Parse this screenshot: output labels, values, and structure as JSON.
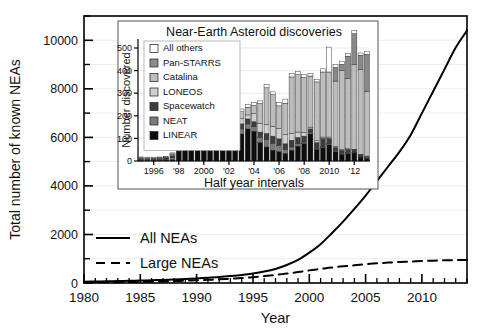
{
  "figure": {
    "background": "#ffffff",
    "line_color": "#000000"
  },
  "chart_data": [
    {
      "id": "main",
      "type": "line",
      "title": "",
      "xlabel": "Year",
      "ylabel": "Total number of known NEAs",
      "xlim": [
        1980,
        2014
      ],
      "ylim": [
        0,
        11000
      ],
      "xticks": [
        1980,
        1985,
        1990,
        1995,
        2000,
        2005,
        2010
      ],
      "xtick_labels": [
        "1980",
        "1985",
        "1990",
        "1995",
        "2000",
        "2005",
        "2010"
      ],
      "yticks": [
        0,
        2000,
        4000,
        6000,
        8000,
        10000
      ],
      "ytick_labels": [
        "0",
        "2000",
        "4000",
        "6000",
        "8000",
        "10000"
      ],
      "yminor": [
        1000,
        3000,
        5000,
        7000,
        9000,
        11000
      ],
      "grid": true,
      "legend_position": "lower-left",
      "series": [
        {
          "name": "All NEAs",
          "style": "solid",
          "x": [
            1980,
            1981,
            1982,
            1983,
            1984,
            1985,
            1986,
            1987,
            1988,
            1989,
            1990,
            1991,
            1992,
            1993,
            1994,
            1995,
            1996,
            1997,
            1998,
            1999,
            2000,
            2001,
            2002,
            2003,
            2004,
            2005,
            2006,
            2007,
            2008,
            2009,
            2010,
            2011,
            2012,
            2013,
            2014
          ],
          "values": [
            55,
            60,
            68,
            78,
            88,
            100,
            112,
            128,
            145,
            165,
            190,
            215,
            245,
            285,
            330,
            390,
            470,
            580,
            740,
            950,
            1250,
            1600,
            2050,
            2530,
            3050,
            3600,
            4200,
            4800,
            5400,
            6100,
            7000,
            7900,
            8800,
            9700,
            10400
          ]
        },
        {
          "name": "Large NEAs",
          "style": "dashed",
          "x": [
            1980,
            1981,
            1982,
            1983,
            1984,
            1985,
            1986,
            1987,
            1988,
            1989,
            1990,
            1991,
            1992,
            1993,
            1994,
            1995,
            1996,
            1997,
            1998,
            1999,
            2000,
            2001,
            2002,
            2003,
            2004,
            2005,
            2006,
            2007,
            2008,
            2009,
            2010,
            2011,
            2012,
            2013,
            2014
          ],
          "values": [
            22,
            26,
            30,
            35,
            42,
            50,
            58,
            68,
            80,
            95,
            112,
            130,
            150,
            175,
            205,
            240,
            285,
            330,
            390,
            450,
            520,
            580,
            640,
            690,
            730,
            775,
            810,
            840,
            865,
            885,
            905,
            920,
            935,
            945,
            950
          ]
        }
      ]
    },
    {
      "id": "inset",
      "type": "bar",
      "stacked": true,
      "title": "Near-Earth Asteroid discoveries",
      "xlabel": "Half year intervals",
      "ylabel": "Number discovered",
      "ylim": [
        0,
        540
      ],
      "yticks": [
        0,
        100,
        200,
        300,
        400,
        500
      ],
      "ytick_labels": [
        "0",
        "100",
        "200",
        "300",
        "400",
        "500"
      ],
      "grid": true,
      "legend_position": "upper-left",
      "xtick_labels": [
        "1996",
        "'98",
        "2000",
        "'02",
        "'04",
        "'06",
        "'08",
        "2010",
        "'12"
      ],
      "xtick_indices": [
        2,
        6,
        10,
        14,
        18,
        22,
        26,
        30,
        34
      ],
      "categories": [
        "1995H1",
        "1995H2",
        "1996H1",
        "1996H2",
        "1997H1",
        "1997H2",
        "1998H1",
        "1998H2",
        "1999H1",
        "1999H2",
        "2000H1",
        "2000H2",
        "2001H1",
        "2001H2",
        "2002H1",
        "2002H2",
        "2003H1",
        "2003H2",
        "2004H1",
        "2004H2",
        "2005H1",
        "2005H2",
        "2006H1",
        "2006H2",
        "2007H1",
        "2007H2",
        "2008H1",
        "2008H2",
        "2009H1",
        "2009H2",
        "2010H1",
        "2010H2",
        "2011H1",
        "2011H2",
        "2012H1",
        "2012H2",
        "2013H1"
      ],
      "series": [
        {
          "name": "LINEAR",
          "color": "#0d0d0d",
          "values": [
            2,
            3,
            2,
            3,
            4,
            6,
            44,
            62,
            75,
            96,
            110,
            148,
            160,
            196,
            120,
            100,
            120,
            142,
            132,
            82,
            62,
            48,
            42,
            34,
            48,
            66,
            78,
            120,
            52,
            58,
            72,
            42,
            30,
            34,
            36,
            18,
            12
          ]
        },
        {
          "name": "NEAT",
          "color": "#7a7a7a",
          "values": [
            4,
            3,
            4,
            4,
            4,
            8,
            16,
            22,
            14,
            10,
            20,
            10,
            38,
            16,
            24,
            20,
            22,
            22,
            20,
            22,
            32,
            30,
            26,
            18,
            14,
            10,
            6,
            6,
            4,
            4,
            4,
            4,
            4,
            4,
            2,
            2,
            2
          ]
        },
        {
          "name": "Spacewatch",
          "color": "#3d3d3d",
          "values": [
            6,
            5,
            5,
            5,
            6,
            10,
            14,
            16,
            12,
            14,
            16,
            14,
            22,
            16,
            24,
            20,
            22,
            22,
            22,
            24,
            28,
            32,
            30,
            24,
            30,
            28,
            26,
            16,
            26,
            38,
            24,
            14,
            14,
            14,
            12,
            8,
            6
          ]
        },
        {
          "name": "LONEOS",
          "color": "#cfcfcf",
          "values": [
            2,
            2,
            2,
            2,
            2,
            4,
            14,
            18,
            18,
            20,
            24,
            22,
            28,
            14,
            34,
            30,
            24,
            18,
            36,
            38,
            40,
            44,
            46,
            40,
            30,
            24,
            16,
            8,
            8,
            6,
            6,
            4,
            2,
            2,
            2,
            2,
            2
          ]
        },
        {
          "name": "Catalina",
          "color": "#bdbdbd",
          "values": [
            2,
            2,
            2,
            2,
            2,
            4,
            12,
            14,
            14,
            16,
            24,
            30,
            40,
            30,
            32,
            26,
            30,
            34,
            36,
            88,
            162,
            140,
            100,
            140,
            250,
            254,
            244,
            226,
            260,
            288,
            288,
            290,
            350,
            310,
            374,
            374,
            286
          ]
        },
        {
          "name": "Pan-STARRS",
          "color": "#8a8a8a",
          "values": [
            0,
            0,
            0,
            0,
            0,
            0,
            0,
            0,
            0,
            0,
            0,
            0,
            0,
            0,
            0,
            0,
            0,
            0,
            0,
            0,
            0,
            0,
            0,
            0,
            0,
            0,
            0,
            0,
            0,
            0,
            0,
            60,
            28,
            100,
            138,
            64,
            164
          ]
        },
        {
          "name": "All others",
          "color": "#ffffff",
          "values": [
            2,
            2,
            2,
            2,
            2,
            4,
            8,
            10,
            8,
            10,
            10,
            10,
            12,
            12,
            12,
            12,
            12,
            12,
            14,
            12,
            14,
            12,
            14,
            18,
            16,
            14,
            14,
            12,
            12,
            14,
            110,
            12,
            14,
            12,
            14,
            10,
            14
          ]
        }
      ],
      "legend_order": [
        "All others",
        "Pan-STARRS",
        "Catalina",
        "LONEOS",
        "Spacewatch",
        "NEAT",
        "LINEAR"
      ]
    }
  ]
}
